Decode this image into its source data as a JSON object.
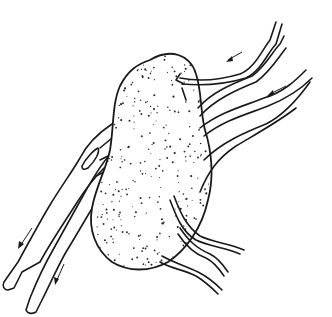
{
  "figure": {
    "ink_color": "#1a1a1a",
    "background_color": "#ffffff",
    "labels": [],
    "flow_arrows": [
      {
        "id": "upper-right-1",
        "direction": "toward-organ"
      },
      {
        "id": "upper-right-2",
        "direction": "toward-organ"
      },
      {
        "id": "lower-left-1",
        "direction": "away-from-organ"
      },
      {
        "id": "lower-left-2",
        "direction": "away-from-organ"
      }
    ],
    "vessel_groups": [
      {
        "id": "upper-right-vessels",
        "count": 2
      },
      {
        "id": "mid-right-vessels",
        "count": 2
      },
      {
        "id": "left-trunk-vessels",
        "count": 2
      },
      {
        "id": "lower-vessels",
        "count": 3
      }
    ]
  }
}
